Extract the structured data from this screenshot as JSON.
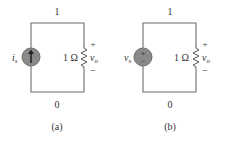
{
  "figure": {
    "panels": [
      {
        "caption": "(a)",
        "top_node": "1",
        "bottom_node": "0",
        "source": {
          "type": "current-source",
          "label": "i",
          "label_sub": "s",
          "direction": "up"
        },
        "resistor": {
          "value": "1 Ω"
        },
        "output": {
          "label": "v",
          "label_sub": "o",
          "plus": "+",
          "minus": "−"
        }
      },
      {
        "caption": "(b)",
        "top_node": "1",
        "bottom_node": "0",
        "source": {
          "type": "voltage-source",
          "label": "v",
          "label_sub": "s",
          "plus": "+",
          "minus": "−"
        },
        "resistor": {
          "value": "1 Ω"
        },
        "output": {
          "label": "v",
          "label_sub": "o",
          "plus": "+",
          "minus": "−"
        }
      }
    ],
    "colors": {
      "wire": "#6e6e6e",
      "source_fill": "#8a8a8a",
      "text": "#333333"
    }
  }
}
